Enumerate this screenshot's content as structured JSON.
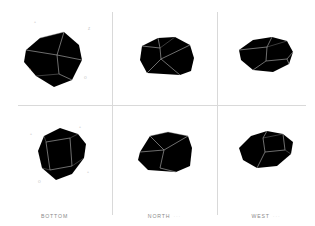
{
  "figure": {
    "background_color": "#ffffff",
    "divider_color": "#d9d9d9",
    "shape_fill": "#000000",
    "edge_color": "#9c9c9c",
    "caption_color": "#8a8a8a",
    "marker_color": "#b4b4b4"
  },
  "panels": [
    {
      "id": "top-left",
      "view": "oblique-top",
      "caption": "",
      "axis_markers": [
        {
          "label": "+",
          "x": 34,
          "y": 21
        },
        {
          "label": "Z",
          "x": 88,
          "y": 28
        },
        {
          "label": "+",
          "x": 29,
          "y": 68
        },
        {
          "label": "O",
          "x": 84,
          "y": 77
        }
      ]
    },
    {
      "id": "top-middle",
      "view": "north-elevation",
      "caption": "",
      "axis_markers": []
    },
    {
      "id": "top-right",
      "view": "west-elevation",
      "caption": "",
      "axis_markers": []
    },
    {
      "id": "bottom-left",
      "view": "bottom-plan",
      "caption": "BOTTOM",
      "caption_sub": "",
      "axis_markers": [
        {
          "label": "+",
          "x": 30,
          "y": 133
        },
        {
          "label": "+",
          "x": 79,
          "y": 126
        },
        {
          "label": "+",
          "x": 87,
          "y": 171
        },
        {
          "label": "O",
          "x": 38,
          "y": 181
        }
      ]
    },
    {
      "id": "bottom-middle",
      "view": "north-elevation-shaded",
      "caption": "NORTH",
      "caption_sub": "···",
      "axis_markers": []
    },
    {
      "id": "bottom-right",
      "view": "west-elevation-shaded",
      "caption": "WEST",
      "caption_sub": "···",
      "axis_markers": []
    }
  ],
  "captions": {
    "bottom_left": "BOTTOM",
    "bottom_left_sub": "",
    "bottom_middle": "NORTH",
    "bottom_middle_sub": "···",
    "bottom_right": "WEST",
    "bottom_right_sub": "···"
  }
}
